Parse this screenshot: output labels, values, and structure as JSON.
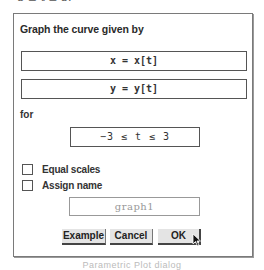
{
  "cut_text": "−3 ≤ t ≤ 3.",
  "dialog": {
    "title": "Graph the curve given by",
    "x_field": "x = x[t]",
    "y_field": "y = y[t]",
    "for_label": "for",
    "range_field": "−3 ≤ t ≤ 3",
    "checkboxes": [
      {
        "label": "Equal scales",
        "checked": false
      },
      {
        "label": "Assign name",
        "checked": false
      }
    ],
    "name_field": "graph1",
    "buttons": {
      "example": "Example",
      "cancel": "Cancel",
      "ok": "OK"
    }
  },
  "caption": "Parametric Plot dialog"
}
